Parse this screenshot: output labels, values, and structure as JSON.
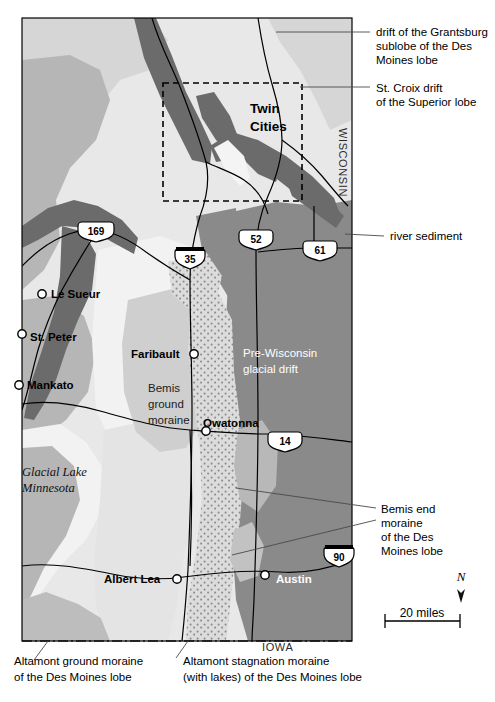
{
  "figure": {
    "type": "geologic-map",
    "region": "Southern Minnesota",
    "background_color": "#ffffff"
  },
  "legend_callouts": [
    {
      "id": "grantsburg",
      "text_lines": [
        "drift of the Grantsburg",
        "sublobe of the Des",
        "Moines lobe"
      ],
      "x": 376,
      "y": 31
    },
    {
      "id": "st-croix",
      "text_lines": [
        "St. Croix drift",
        "of the Superior lobe"
      ],
      "x": 376,
      "y": 89
    },
    {
      "id": "river-sediment",
      "text_lines": [
        "river sediment"
      ],
      "x": 390,
      "y": 239
    },
    {
      "id": "bemis-end-moraine",
      "text_lines": [
        "Bemis end",
        "moraine",
        "of the Des",
        "Moines lobe"
      ],
      "x": 381,
      "y": 510
    },
    {
      "id": "altamont-ground",
      "text_lines": [
        "Altamont ground moraine",
        "of the Des Moines lobe"
      ],
      "x": 14,
      "y": 661
    },
    {
      "id": "altamont-stagnation",
      "text_lines": [
        "Altamont stagnation moraine",
        "(with lakes) of the Des Moines lobe"
      ],
      "x": 183,
      "y": 661
    }
  ],
  "map_unit_labels": [
    {
      "id": "pre-wisconsin",
      "text_lines": [
        "Pre-Wisconsin",
        "glacial drift"
      ],
      "style": "white",
      "x": 243,
      "y": 352
    },
    {
      "id": "bemis-ground-moraine",
      "text_lines": [
        "Bemis",
        "ground",
        "moraine"
      ],
      "style": "dark",
      "x": 148,
      "y": 388
    },
    {
      "id": "glacial-lake-minnesota",
      "text_lines": [
        "Glacial Lake",
        "Minnesota"
      ],
      "style": "italic-serif",
      "x": 22,
      "y": 471
    }
  ],
  "cities": [
    {
      "name": "Twin Cities",
      "label_lines": [
        "Twin",
        "Cities"
      ],
      "style": "big-dark",
      "marker": false,
      "x": 250,
      "y": 108,
      "mx": 0,
      "my": 0
    },
    {
      "name": "Le Sueur",
      "label_lines": [
        "Le Sueur"
      ],
      "style": "dark",
      "marker": true,
      "mx": 42,
      "my": 294,
      "x": 51,
      "y": 298
    },
    {
      "name": "St. Peter",
      "label_lines": [
        "St. Peter"
      ],
      "style": "dark",
      "marker": true,
      "mx": 22,
      "my": 334,
      "x": 30,
      "y": 341
    },
    {
      "name": "Mankato",
      "label_lines": [
        "Mankato"
      ],
      "style": "dark",
      "marker": true,
      "mx": 19,
      "my": 385,
      "x": 27,
      "y": 389
    },
    {
      "name": "Faribault",
      "label_lines": [
        "Faribault"
      ],
      "style": "dark",
      "marker": true,
      "mx": 194,
      "my": 354,
      "x": 131,
      "y": 358
    },
    {
      "name": "Owatonna",
      "label_lines": [
        "Owatonna"
      ],
      "style": "dark",
      "marker": true,
      "mx": 206,
      "my": 431,
      "x": 203,
      "y": 427
    },
    {
      "name": "Albert Lea",
      "label_lines": [
        "Albert Lea"
      ],
      "style": "dark",
      "marker": true,
      "mx": 177,
      "my": 579,
      "x": 104,
      "y": 583
    },
    {
      "name": "Austin",
      "label_lines": [
        "Austin"
      ],
      "style": "white",
      "marker": true,
      "mx": 265,
      "my": 575,
      "x": 276,
      "y": 583
    }
  ],
  "state_labels": [
    {
      "name": "WISCONSIN",
      "text": "WISCONSIN",
      "orientation": "vertical",
      "x": 339,
      "y": 128
    },
    {
      "name": "IOWA",
      "text": "IOWA",
      "orientation": "horizontal",
      "x": 262,
      "y": 647
    }
  ],
  "highway_shields": [
    {
      "number": "169",
      "type": "us",
      "x": 96,
      "y": 231
    },
    {
      "number": "35",
      "type": "interstate",
      "x": 190,
      "y": 259
    },
    {
      "number": "52",
      "type": "us",
      "x": 256,
      "y": 239
    },
    {
      "number": "61",
      "type": "us",
      "x": 320,
      "y": 250
    },
    {
      "number": "14",
      "type": "us",
      "x": 285,
      "y": 441
    },
    {
      "number": "90",
      "type": "interstate",
      "x": 339,
      "y": 557
    }
  ],
  "scale_bar": {
    "label": "20 miles",
    "x": 385,
    "y": 620,
    "length_px": 75
  },
  "north_arrow": {
    "label": "N",
    "x": 461,
    "y": 578
  },
  "inset_box": {
    "name": "twin-cities-inset",
    "x": 163,
    "y": 83,
    "width": 139,
    "height": 118
  },
  "colors": {
    "grantsburg_drift": "#d9d9d9",
    "st_croix_drift": "#e8e8e8",
    "river_sediment": "#6e6e6e",
    "pre_wisconsin_drift": "#8a8a8a",
    "bemis_ground_moraine": "#c6c6c6",
    "altamont_ground_moraine": "#b4b4b4",
    "altamont_stagnation_moraine": "#e2e2e2",
    "bemis_end_moraine_stipple": "#cfcfcf",
    "glacial_lake": "#f2f2f2",
    "line": "#000000",
    "white": "#ffffff"
  }
}
